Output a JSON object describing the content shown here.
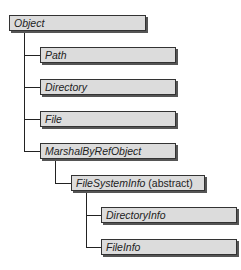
{
  "diagram": {
    "nodes": [
      {
        "id": "object",
        "label": "Object",
        "suffix": ""
      },
      {
        "id": "path",
        "label": "Path",
        "suffix": "",
        "parent": "object"
      },
      {
        "id": "directory",
        "label": "Directory",
        "suffix": "",
        "parent": "object"
      },
      {
        "id": "file",
        "label": "File",
        "suffix": "",
        "parent": "object"
      },
      {
        "id": "marshal",
        "label": "MarshalByRefObject",
        "suffix": "",
        "parent": "object"
      },
      {
        "id": "fsi",
        "label": "FileSystemInfo",
        "suffix": " (abstract)",
        "parent": "marshal"
      },
      {
        "id": "dirinfo",
        "label": "DirectoryInfo",
        "suffix": "",
        "parent": "fsi"
      },
      {
        "id": "fileinfo",
        "label": "FileInfo",
        "suffix": "",
        "parent": "fsi"
      }
    ],
    "colors": {
      "box_fill": "#dcdcdc",
      "border": "#333333",
      "line": "#222222"
    }
  }
}
